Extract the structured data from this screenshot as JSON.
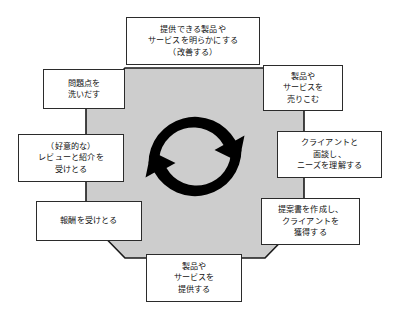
{
  "diagram": {
    "type": "cycle-diagram",
    "center_shape": {
      "name": "octagon",
      "fill_color": "#cdcdcd",
      "stroke_color": "#1a1a1a"
    },
    "center_icon": {
      "name": "circular-arrows-icon",
      "description": "clockwise recycling arrows",
      "color": "#000000",
      "direction": "clockwise",
      "arrow_count": 2
    },
    "box_style": {
      "fill_color": "#ffffff",
      "border_color": "#2b2b2b"
    },
    "nodes": [
      {
        "id": "node-top",
        "position": "top",
        "order": 1,
        "text": "提供できる製品や\nサービスを明らかにする\n（改善する）"
      },
      {
        "id": "node-top-right",
        "position": "top-right",
        "order": 2,
        "text": "製品や\nサービスを\n売りこむ"
      },
      {
        "id": "node-right",
        "position": "right",
        "order": 3,
        "text": "クライアントと\n面談し、\nニーズを理解する"
      },
      {
        "id": "node-bottom-right",
        "position": "bottom-right",
        "order": 4,
        "text": "提案書を作成し、\nクライアントを\n獲得する"
      },
      {
        "id": "node-bottom",
        "position": "bottom",
        "order": 5,
        "text": "製品や\nサービスを\n提供する"
      },
      {
        "id": "node-bottom-left",
        "position": "bottom-left",
        "order": 6,
        "text": "報酬を受けとる"
      },
      {
        "id": "node-left",
        "position": "left",
        "order": 7,
        "text": "（好意的な）\nレビューと紹介を\n受けとる"
      },
      {
        "id": "node-top-left",
        "position": "top-left",
        "order": 8,
        "text": "問題点を\n洗いだす"
      }
    ]
  }
}
